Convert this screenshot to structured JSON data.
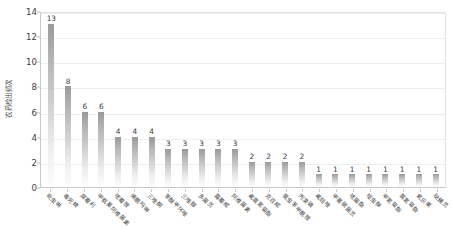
{
  "chart_data": {
    "type": "bar",
    "title": "",
    "xlabel": "",
    "ylabel": "农药检出频次",
    "ylim": [
      0,
      14
    ],
    "ytick_step": 2,
    "yticks": [
      0,
      2,
      4,
      6,
      8,
      10,
      12,
      14
    ],
    "grid": true,
    "legend": "none",
    "bar_color": "#b5b5b5",
    "value_labels": true,
    "categories": [
      "吡虫啉",
      "毒死蜱",
      "腐霉利",
      "甲氨基阿维菌素",
      "嘧霉胺",
      "烯酰吗啉",
      "三唑酮",
      "苯醚甲环唑",
      "三唑醇",
      "多菌灵",
      "霜霉威",
      "阿维菌素",
      "氟氯氰菊酯",
      "克百威",
      "氯虫苯甲酰胺",
      "丙溴磷",
      "氟硅唑",
      "甲基硫菌灵",
      "嘧菌酯",
      "啶虫脒",
      "甲氰菊酯",
      "氯氰菊酯",
      "氧乐果",
      "哒螨灵"
    ],
    "values": [
      13,
      8,
      6,
      6,
      4,
      4,
      4,
      3,
      3,
      3,
      3,
      3,
      2,
      2,
      2,
      2,
      1,
      1,
      1,
      1,
      1,
      1,
      1,
      1
    ]
  }
}
